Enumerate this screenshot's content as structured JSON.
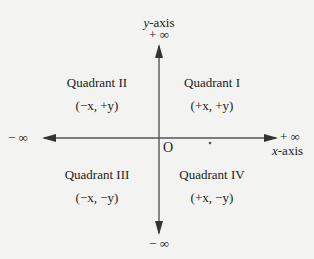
{
  "axes": {
    "y_label": "y-axis",
    "y_pos_inf": "+ ∞",
    "y_neg_inf": "− ∞",
    "x_label": "x-axis",
    "x_pos_inf": "+ ∞",
    "x_neg_inf": "− ∞",
    "origin": "O"
  },
  "quadrants": [
    {
      "name": "Quadrant I",
      "signs": "(+x, +y)"
    },
    {
      "name": "Quadrant II",
      "signs": "(−x, +y)"
    },
    {
      "name": "Quadrant III",
      "signs": "(−x, −y)"
    },
    {
      "name": "Quadrant IV",
      "signs": "(+x, −y)"
    }
  ],
  "colors": {
    "axis": "#555555",
    "background": "#f3f3f1"
  }
}
